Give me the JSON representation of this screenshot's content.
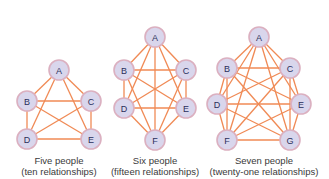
{
  "colors": {
    "edge": "#f08a55",
    "node_fill": "#d9d6ec",
    "node_stroke": "#dbb0c0",
    "node_text": "#2a2f5a",
    "caption_text": "#3a3a3a"
  },
  "graphs": [
    {
      "id": "five",
      "caption_line1": "Five people",
      "caption_line2": "(ten relationships)",
      "caption_x": 59,
      "nodes": [
        {
          "label": "A",
          "x": 59,
          "y": 70
        },
        {
          "label": "B",
          "x": 27,
          "y": 101
        },
        {
          "label": "C",
          "x": 91,
          "y": 101
        },
        {
          "label": "D",
          "x": 27,
          "y": 139
        },
        {
          "label": "E",
          "x": 91,
          "y": 139
        }
      ]
    },
    {
      "id": "six",
      "caption_line1": "Six people",
      "caption_line2": "(fifteen relationships)",
      "caption_x": 155,
      "nodes": [
        {
          "label": "A",
          "x": 155,
          "y": 37
        },
        {
          "label": "B",
          "x": 124,
          "y": 70
        },
        {
          "label": "C",
          "x": 186,
          "y": 70
        },
        {
          "label": "D",
          "x": 124,
          "y": 108
        },
        {
          "label": "E",
          "x": 186,
          "y": 108
        },
        {
          "label": "F",
          "x": 155,
          "y": 140
        }
      ]
    },
    {
      "id": "seven",
      "caption_line1": "Seven people",
      "caption_line2": "(twenty-one relationships)",
      "caption_x": 259,
      "nodes": [
        {
          "label": "A",
          "x": 259,
          "y": 37
        },
        {
          "label": "B",
          "x": 227,
          "y": 68
        },
        {
          "label": "C",
          "x": 290,
          "y": 68
        },
        {
          "label": "D",
          "x": 217,
          "y": 104
        },
        {
          "label": "E",
          "x": 301,
          "y": 104
        },
        {
          "label": "F",
          "x": 227,
          "y": 140
        },
        {
          "label": "G",
          "x": 290,
          "y": 140
        }
      ]
    }
  ]
}
